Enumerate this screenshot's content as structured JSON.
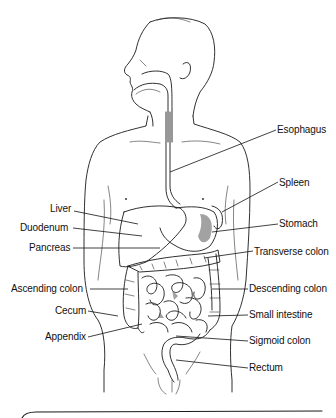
{
  "diagram": {
    "labels_left": [
      {
        "id": "liver",
        "text": "Liver",
        "x": 50,
        "y": 208
      },
      {
        "id": "duodenum",
        "text": "Duodenum",
        "x": 20,
        "y": 232
      },
      {
        "id": "pancreas",
        "text": "Pancreas",
        "x": 29,
        "y": 243
      },
      {
        "id": "ascending-colon",
        "text": "Ascending colon",
        "x": 11,
        "y": 284
      },
      {
        "id": "cecum",
        "text": "Cecum",
        "x": 55,
        "y": 306
      },
      {
        "id": "appendix",
        "text": "Appendix",
        "x": 45,
        "y": 332
      }
    ],
    "labels_right": [
      {
        "id": "esophagus",
        "text": "Esophagus",
        "x": 277,
        "y": 124
      },
      {
        "id": "spleen",
        "text": "Spleen",
        "x": 279,
        "y": 176
      },
      {
        "id": "stomach",
        "text": "Stomach",
        "x": 279,
        "y": 218
      },
      {
        "id": "transverse-colon",
        "text": "Transverse colon",
        "x": 254,
        "y": 246
      },
      {
        "id": "descending-colon",
        "text": "Descending colon",
        "x": 249,
        "y": 284
      },
      {
        "id": "small-intestine",
        "text": "Small intestine",
        "x": 249,
        "y": 310
      },
      {
        "id": "sigmoid-colon",
        "text": "Sigmoid colon",
        "x": 249,
        "y": 336
      },
      {
        "id": "rectum",
        "text": "Rectum",
        "x": 249,
        "y": 363
      }
    ],
    "colors": {
      "ink": "#1a1a1a",
      "background": "#ffffff"
    }
  }
}
